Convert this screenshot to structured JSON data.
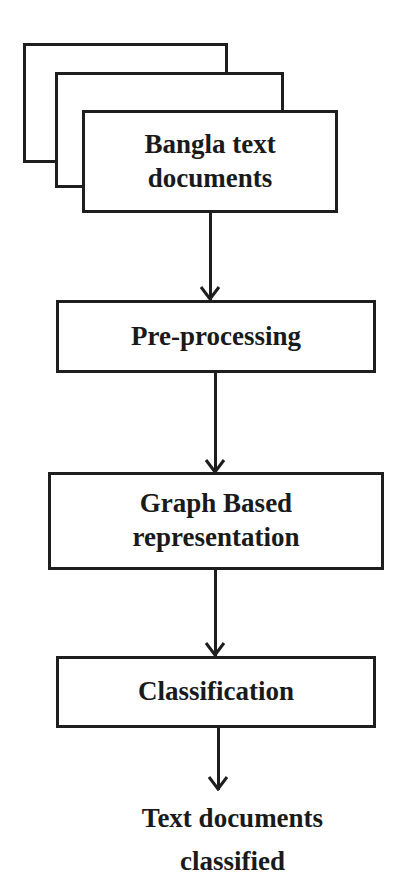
{
  "diagram": {
    "type": "flowchart",
    "direction": "top-to-bottom",
    "colors": {
      "stroke": "#1e1e1e",
      "text": "#1a1a1a",
      "background": "#ffffff"
    },
    "input": {
      "shape": "stacked-documents",
      "line1": "Bangla text",
      "line2": "documents"
    },
    "steps": [
      {
        "id": "preprocessing",
        "line1": "Pre-processing"
      },
      {
        "id": "graph",
        "line1": "Graph Based",
        "line2": "representation"
      },
      {
        "id": "classification",
        "line1": "Classification"
      }
    ],
    "output": {
      "line1": "Text documents",
      "line2": "classified"
    },
    "edges": [
      {
        "from": "input",
        "to": "preprocessing"
      },
      {
        "from": "preprocessing",
        "to": "graph"
      },
      {
        "from": "graph",
        "to": "classification"
      },
      {
        "from": "classification",
        "to": "output"
      }
    ]
  }
}
